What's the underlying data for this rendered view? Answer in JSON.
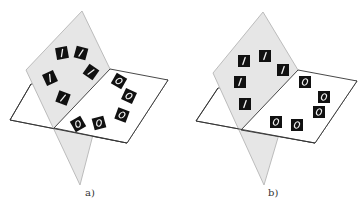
{
  "figure": {
    "colors": {
      "gray_plane": "#e6e6e6",
      "gray_plane_stroke": "#b5b5b5",
      "white_plane_stroke": "#333333",
      "tile": "#111111",
      "digit_stroke": "#f2f2f2"
    },
    "panels": [
      {
        "id": "a",
        "caption": "a)",
        "tiles_on_gray_plane": [
          {
            "digit": "1",
            "x": 62,
            "y": 53,
            "rot": -10
          },
          {
            "digit": "1",
            "x": 81,
            "y": 53,
            "rot": 15
          },
          {
            "digit": "1",
            "x": 91,
            "y": 72,
            "rot": 35
          },
          {
            "digit": "1",
            "x": 50,
            "y": 78,
            "rot": -25
          },
          {
            "digit": "1",
            "x": 63,
            "y": 98,
            "rot": 20
          }
        ],
        "tiles_on_white_plane": [
          {
            "digit": "0",
            "x": 119,
            "y": 81,
            "rot": 30
          },
          {
            "digit": "0",
            "x": 129,
            "y": 96,
            "rot": 25
          },
          {
            "digit": "0",
            "x": 122,
            "y": 115,
            "rot": 20
          },
          {
            "digit": "0",
            "x": 99,
            "y": 123,
            "rot": -15
          },
          {
            "digit": "0",
            "x": 78,
            "y": 124,
            "rot": -30
          }
        ]
      },
      {
        "id": "b",
        "caption": "b)",
        "tiles_on_gray_plane": [
          {
            "digit": "1",
            "x": 244,
            "y": 61,
            "rot": 0
          },
          {
            "digit": "1",
            "x": 265,
            "y": 56,
            "rot": 0
          },
          {
            "digit": "1",
            "x": 283,
            "y": 70,
            "rot": 0
          },
          {
            "digit": "1",
            "x": 240,
            "y": 82,
            "rot": 0
          },
          {
            "digit": "1",
            "x": 245,
            "y": 104,
            "rot": 0
          }
        ],
        "tiles_on_white_plane": [
          {
            "digit": "0",
            "x": 305,
            "y": 82,
            "rot": 0
          },
          {
            "digit": "0",
            "x": 324,
            "y": 97,
            "rot": 0
          },
          {
            "digit": "0",
            "x": 319,
            "y": 112,
            "rot": 0
          },
          {
            "digit": "0",
            "x": 297,
            "y": 125,
            "rot": 0
          },
          {
            "digit": "0",
            "x": 276,
            "y": 122,
            "rot": 0
          }
        ]
      }
    ]
  }
}
